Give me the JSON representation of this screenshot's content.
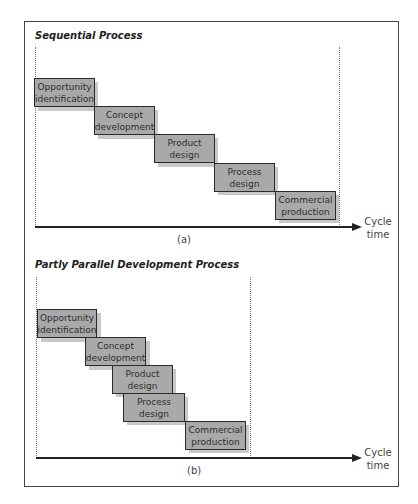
{
  "header": {
    "cropped_text": ""
  },
  "panels": [
    {
      "id": "a",
      "title": "Sequential Process",
      "label": "(a)",
      "axis_label": "Cycle time",
      "axis_label_line1": "Cycle",
      "axis_label_line2": "time",
      "stages": [
        {
          "line1": "Opportunity",
          "line2": "identification"
        },
        {
          "line1": "Concept",
          "line2": "development"
        },
        {
          "line1": "Product",
          "line2": "design"
        },
        {
          "line1": "Process",
          "line2": "design"
        },
        {
          "line1": "Commercial",
          "line2": "production"
        }
      ]
    },
    {
      "id": "b",
      "title": "Partly Parallel Development Process",
      "label": "(b)",
      "axis_label": "Cycle time",
      "axis_label_line1": "Cycle",
      "axis_label_line2": "time",
      "stages": [
        {
          "line1": "Opportunity",
          "line2": "identification"
        },
        {
          "line1": "Concept",
          "line2": "development"
        },
        {
          "line1": "Product",
          "line2": "design"
        },
        {
          "line1": "Process",
          "line2": "design"
        },
        {
          "line1": "Commercial",
          "line2": "production"
        }
      ]
    }
  ],
  "colors": {
    "box_fill": "#a9a9a9",
    "box_shadow": "#c8c8c8",
    "box_border": "#2a2a2a",
    "axis": "#222222"
  }
}
